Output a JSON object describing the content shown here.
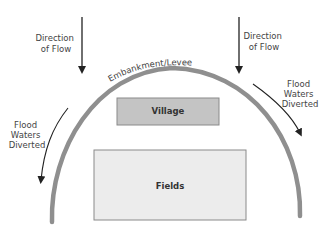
{
  "diagram": {
    "flow_left": [
      "Direction",
      "of Flow"
    ],
    "flow_right": [
      "Direction",
      "of Flow"
    ],
    "embankment_label": "Embankment/Levee",
    "diverted_left": [
      "Flood",
      "Waters",
      "Diverted"
    ],
    "diverted_right": [
      "Flood",
      "Waters",
      "Diverted"
    ],
    "village_label": "Village",
    "fields_label": "Fields",
    "colors": {
      "levee": "#8f8f8f",
      "village_fill": "#c4c4c4",
      "fields_fill": "#ececec",
      "box_stroke": "#8a8a8a",
      "arrow": "#222222",
      "text": "#444444"
    }
  }
}
